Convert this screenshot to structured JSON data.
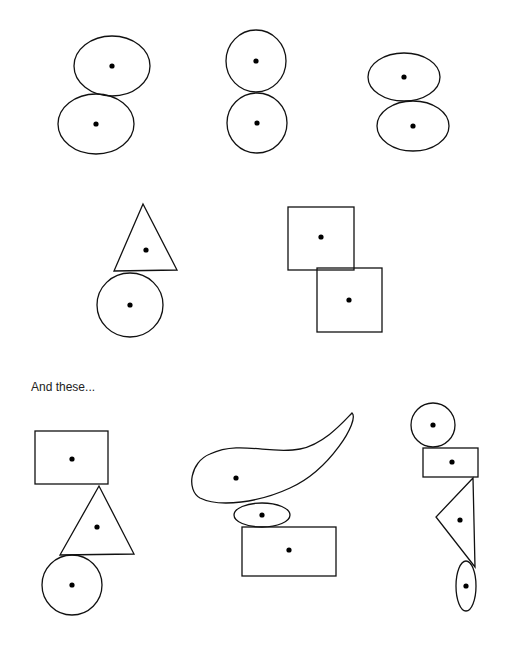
{
  "caption": "And these...",
  "colors": {
    "stroke": "#111111",
    "dot": "#000000",
    "background": "#ffffff"
  },
  "groups": [
    {
      "name": "two-ellipses-offset",
      "shapes": [
        {
          "type": "ellipse",
          "cx": 112,
          "cy": 66,
          "rx": 38,
          "ry": 30
        },
        {
          "type": "ellipse",
          "cx": 96,
          "cy": 124,
          "rx": 38,
          "ry": 30
        }
      ]
    },
    {
      "name": "two-circles-stacked",
      "shapes": [
        {
          "type": "ellipse",
          "cx": 256,
          "cy": 61,
          "rx": 30,
          "ry": 31
        },
        {
          "type": "ellipse",
          "cx": 257,
          "cy": 123,
          "rx": 30,
          "ry": 30
        }
      ]
    },
    {
      "name": "two-flat-ellipses",
      "shapes": [
        {
          "type": "ellipse",
          "cx": 404,
          "cy": 77,
          "rx": 36,
          "ry": 24
        },
        {
          "type": "ellipse",
          "cx": 413,
          "cy": 126,
          "rx": 36,
          "ry": 25
        }
      ]
    },
    {
      "name": "triangle-on-circle",
      "shapes": [
        {
          "type": "triangle",
          "points": "143,204 114,271 177,270",
          "dot": [
            146,
            250
          ]
        },
        {
          "type": "ellipse",
          "cx": 130,
          "cy": 305,
          "rx": 33,
          "ry": 32
        }
      ]
    },
    {
      "name": "two-squares-offset",
      "shapes": [
        {
          "type": "rect",
          "x": 288,
          "y": 207,
          "w": 66,
          "h": 63,
          "dot": [
            321,
            237
          ]
        },
        {
          "type": "rect",
          "x": 317,
          "y": 268,
          "w": 65,
          "h": 64,
          "dot": [
            349,
            300
          ]
        }
      ]
    },
    {
      "name": "rect-triangle-circle",
      "shapes": [
        {
          "type": "rect",
          "x": 35,
          "y": 431,
          "w": 73,
          "h": 53,
          "dot": [
            72,
            459
          ]
        },
        {
          "type": "triangle",
          "points": "99,486 60,555 134,554",
          "dot": [
            97,
            527
          ]
        },
        {
          "type": "ellipse",
          "cx": 72,
          "cy": 585,
          "rx": 30,
          "ry": 30
        }
      ]
    },
    {
      "name": "blob-ellipse-rect",
      "shapes": [
        {
          "type": "path",
          "d": "M 352,413 C 360,420 330,470 290,488 C 260,502 220,508 200,498 C 186,490 190,462 210,454 C 240,440 270,455 300,449 C 325,444 345,420 352,413 Z",
          "dot": [
            236,
            478
          ]
        },
        {
          "type": "ellipse",
          "cx": 262,
          "cy": 515,
          "rx": 28,
          "ry": 12
        },
        {
          "type": "rect",
          "x": 242,
          "y": 527,
          "w": 94,
          "h": 49,
          "dot": [
            289,
            550
          ]
        }
      ]
    },
    {
      "name": "circle-rect-triangle-ellipse",
      "shapes": [
        {
          "type": "ellipse",
          "cx": 433,
          "cy": 425,
          "rx": 22,
          "ry": 22
        },
        {
          "type": "rect",
          "x": 423,
          "y": 448,
          "w": 55,
          "h": 29,
          "dot": [
            452,
            462
          ]
        },
        {
          "type": "triangle",
          "points": "473,478 436,517 475,567",
          "dot": [
            460,
            520
          ]
        },
        {
          "type": "ellipse",
          "cx": 466,
          "cy": 586,
          "rx": 10,
          "ry": 25
        }
      ]
    }
  ]
}
